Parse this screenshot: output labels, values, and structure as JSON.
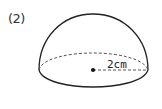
{
  "problem_label": "(2)",
  "figure": {
    "type": "hemisphere",
    "radius_label": "2cm",
    "stroke_color": "#222222",
    "dashed_color": "#444444"
  }
}
